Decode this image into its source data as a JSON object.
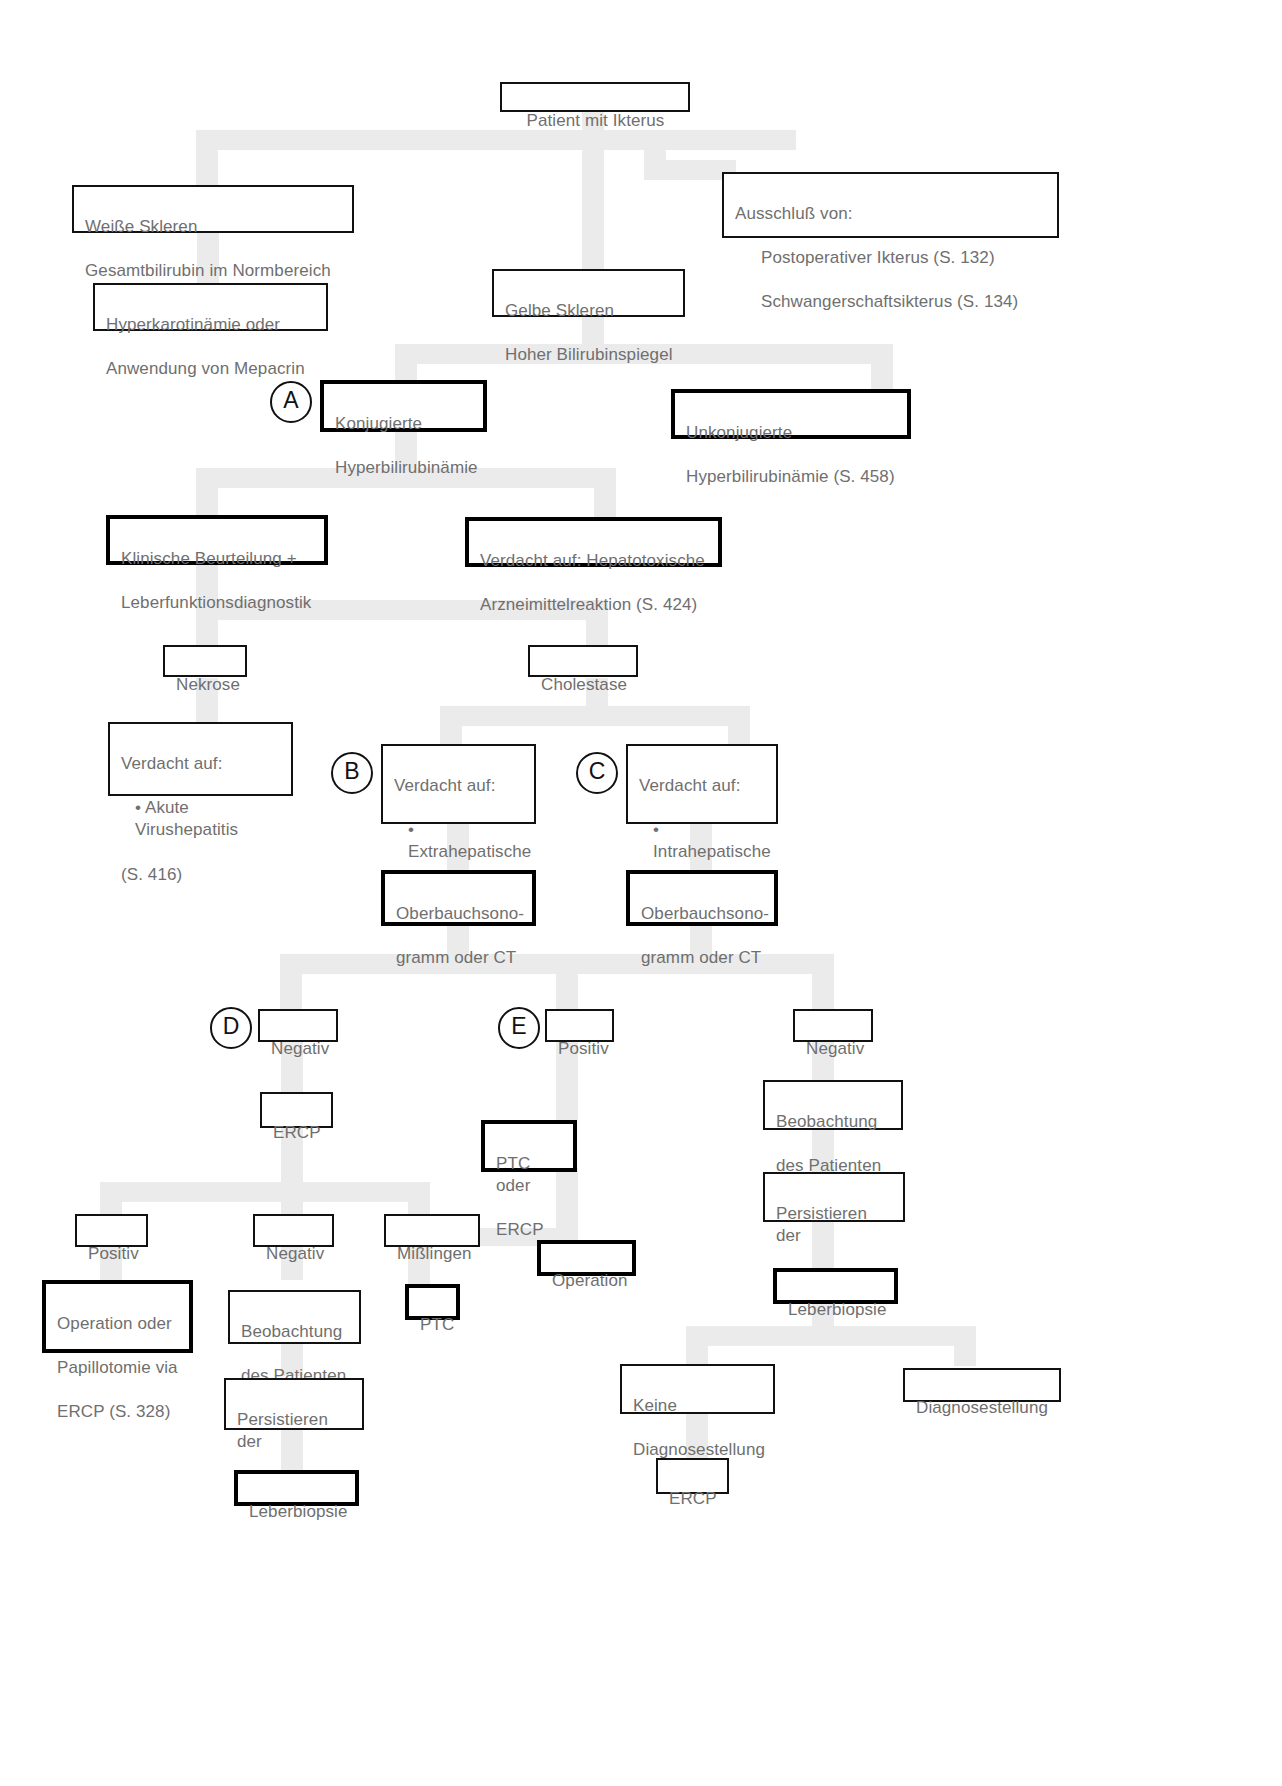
{
  "diagram": {
    "title": "Patient mit Ikterus",
    "language": "de",
    "nodes": {
      "root": {
        "text": "Patient mit Ikterus"
      },
      "white_sclerae": {
        "line1": "Weiße Skleren",
        "line2": "Gesamtbilirubin im Normbereich"
      },
      "exclusion": {
        "line1": "Ausschluß von:",
        "line2": "Postoperativer Ikterus (S. 132)",
        "line3": "Schwangerschaftsikterus (S. 134)"
      },
      "hypercarotin": {
        "line1": "Hyperkarotinämie oder",
        "line2": "Anwendung von Mepacrin"
      },
      "yellow_sclerae": {
        "line1": "Gelbe Skleren",
        "line2": "Hoher Bilirubinspiegel"
      },
      "conjugated": {
        "line1": "Konjugierte",
        "line2": "Hyperbilirubinämie"
      },
      "unconjugated": {
        "line1": "Unkonjugierte",
        "line2": "Hyperbilirubinämie (S. 458)"
      },
      "clinical": {
        "line1": "Klinische Beurteilung +",
        "line2": "Leberfunktionsdiagnostik"
      },
      "hepatotoxic": {
        "line1": "Verdacht auf: Hepatotoxische",
        "line2": "Arzneimittelreaktion (S. 424)"
      },
      "necrosis": {
        "text": "Nekrose"
      },
      "cholestasis": {
        "text": "Cholestase"
      },
      "viral_hep": {
        "line1": "Verdacht auf:",
        "line2": "• Akute Virushepatitis",
        "line3": "(S. 416)"
      },
      "extrahepatic": {
        "line1": "Verdacht auf:",
        "line2": "• Extrahepatische",
        "line3": "Cholestase"
      },
      "intrahepatic": {
        "line1": "Verdacht auf:",
        "line2": "• Intrahepatische",
        "line3": "Cholestase"
      },
      "sono_left": {
        "line1": "Oberbauchsono-",
        "line2": "gramm oder CT"
      },
      "sono_right": {
        "line1": "Oberbauchsono-",
        "line2": "gramm oder CT"
      },
      "neg_d": {
        "text": "Negativ"
      },
      "pos_e": {
        "text": "Positiv"
      },
      "neg_right": {
        "text": "Negativ"
      },
      "ercp_mid": {
        "text": "ERCP"
      },
      "ptc_or_ercp": {
        "line1": "PTC oder",
        "line2": "ERCP"
      },
      "observe_right": {
        "line1": "Beobachtung",
        "line2": "des Patienten"
      },
      "persist_right": {
        "line1": "Persistieren der",
        "line2": "Cholestase"
      },
      "biopsy_right": {
        "text": "Leberbiopsie"
      },
      "operation": {
        "text": "Operation"
      },
      "positiv_bl": {
        "text": "Positiv"
      },
      "negativ_bl": {
        "text": "Negativ"
      },
      "misslingen": {
        "text": "Mißlingen"
      },
      "op_papillo": {
        "line1": "Operation oder",
        "line2": "Papillotomie via",
        "line3": "ERCP (S. 328)"
      },
      "observe_bl": {
        "line1": "Beobachtung",
        "line2": "des Patienten"
      },
      "ptc": {
        "text": "PTC"
      },
      "persist_bl": {
        "line1": "Persistieren der",
        "line2": "Cholestase"
      },
      "biopsy_bl": {
        "text": "Leberbiopsie"
      },
      "no_diagnosis": {
        "line1": "Keine",
        "line2": "Diagnosestellung"
      },
      "diagnosis": {
        "text": "Diagnosestellung"
      },
      "ercp_bottom": {
        "text": "ERCP"
      }
    },
    "markers": {
      "a": "A",
      "b": "B",
      "c": "C",
      "d": "D",
      "e": "E"
    },
    "colors": {
      "box_border": "#111111",
      "box_border_bold": "#000000",
      "text": "#6f6f6f",
      "connector": "#ebebeb",
      "background": "#ffffff"
    }
  }
}
